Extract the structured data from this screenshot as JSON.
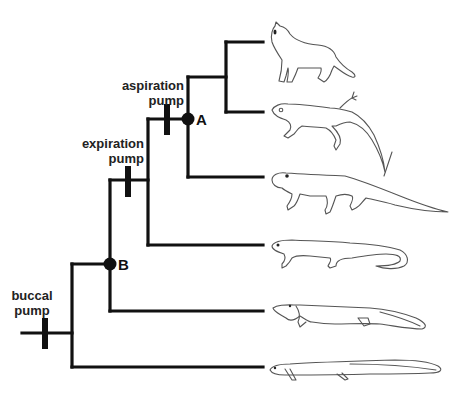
{
  "diagram": {
    "type": "cladogram",
    "colors": {
      "line": "#111111",
      "animal_outline": "#555555",
      "text": "#222222",
      "background": "#ffffff"
    },
    "characters": [
      {
        "id": "buccal",
        "line1": "buccal",
        "line2": "pump"
      },
      {
        "id": "expiration",
        "line1": "expiration",
        "line2": "pump"
      },
      {
        "id": "aspiration",
        "line1": "aspiration",
        "line2": "pump"
      }
    ],
    "nodes": [
      {
        "id": "A",
        "label": "A"
      },
      {
        "id": "B",
        "label": "B"
      }
    ],
    "taxa": [
      {
        "position": 1,
        "icon": "cat-outline-icon"
      },
      {
        "position": 2,
        "icon": "lizard-outline-icon"
      },
      {
        "position": 3,
        "icon": "synapsid-reptile-outline-icon"
      },
      {
        "position": 4,
        "icon": "salamander-outline-icon"
      },
      {
        "position": 5,
        "icon": "lungfish-outline-icon"
      },
      {
        "position": 6,
        "icon": "eel-like-fish-outline-icon"
      }
    ]
  }
}
